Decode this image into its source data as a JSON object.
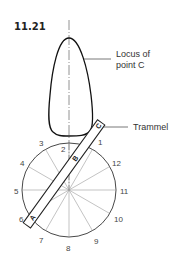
{
  "figure": {
    "number": "11.21",
    "callouts": {
      "locus_line1": "Locus of",
      "locus_line2": "point C",
      "trammel": "Trammel"
    },
    "trammel_points": {
      "a": "A",
      "b": "B",
      "c": "C"
    },
    "circle_divisions": [
      "1",
      "2",
      "3",
      "4",
      "5",
      "6",
      "7",
      "8",
      "9",
      "10",
      "11",
      "12"
    ],
    "colors": {
      "stroke": "#222222",
      "spoke": "#999999",
      "text": "#333333"
    }
  }
}
